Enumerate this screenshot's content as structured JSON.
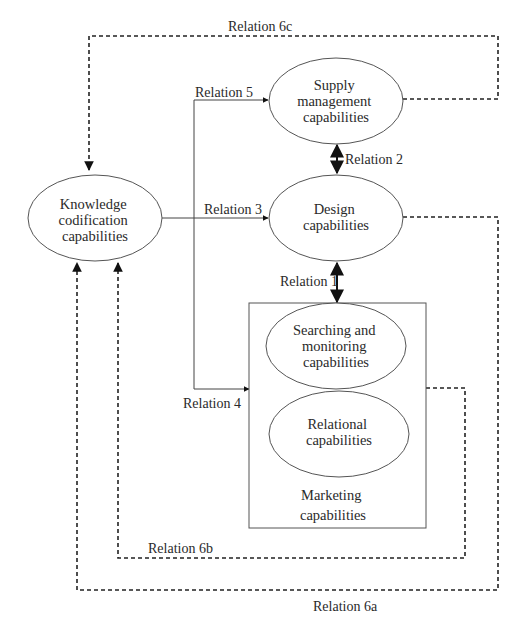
{
  "diagram": {
    "nodes": {
      "knowledge": {
        "lines": [
          "Knowledge",
          "codification",
          "capabilities"
        ]
      },
      "supply": {
        "lines": [
          "Supply",
          "management",
          "capabilities"
        ]
      },
      "design": {
        "lines": [
          "Design",
          "capabilities"
        ]
      },
      "searching": {
        "lines": [
          "Searching and",
          "monitoring",
          "capabilities"
        ]
      },
      "relational": {
        "lines": [
          "Relational",
          "capabilities"
        ]
      },
      "marketing": {
        "lines": [
          "Marketing",
          "capabilities"
        ]
      }
    },
    "relations": {
      "r1": "Relation 1",
      "r2": "Relation 2",
      "r3": "Relation 3",
      "r4": "Relation 4",
      "r5": "Relation 5",
      "r6a": "Relation 6a",
      "r6b": "Relation 6b",
      "r6c": "Relation 6c"
    },
    "colors": {
      "line": "#444444",
      "text": "#2a2a2a",
      "background": "#ffffff"
    }
  }
}
